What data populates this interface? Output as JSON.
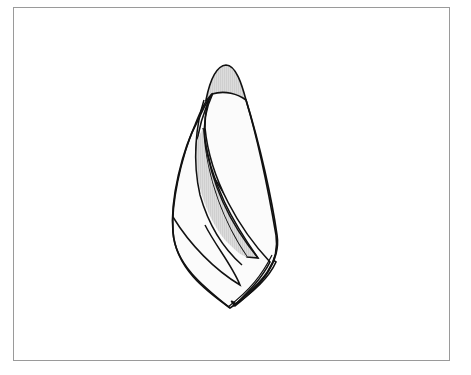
{
  "figure": {
    "type": "line-drawing",
    "frame_color": "#9a9a9a",
    "stroke_color": "#111111",
    "fill_light": "#fbfbfb",
    "fill_shaded": "#d9d9d9"
  }
}
